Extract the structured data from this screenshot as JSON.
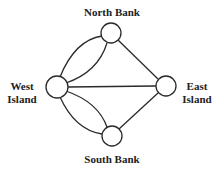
{
  "colors": {
    "stroke": "#2a2a2a",
    "node_fill": "#ffffff",
    "text": "#222222"
  },
  "nodes": [
    {
      "id": "north",
      "label": "North Bank",
      "x": 111,
      "y": 33,
      "r": 10
    },
    {
      "id": "west",
      "label": "West\nIsland",
      "x": 57,
      "y": 87,
      "r": 11
    },
    {
      "id": "east",
      "label": "East\nIsland",
      "x": 166,
      "y": 86,
      "r": 10
    },
    {
      "id": "south",
      "label": "South Bank",
      "x": 112,
      "y": 136,
      "r": 10
    }
  ],
  "edges": [
    {
      "from": "west",
      "to": "north",
      "curve": "outer"
    },
    {
      "from": "west",
      "to": "north",
      "curve": "inner"
    },
    {
      "from": "west",
      "to": "south",
      "curve": "outer"
    },
    {
      "from": "west",
      "to": "south",
      "curve": "inner"
    },
    {
      "from": "west",
      "to": "east",
      "curve": "straight"
    },
    {
      "from": "north",
      "to": "east",
      "curve": "straight"
    },
    {
      "from": "south",
      "to": "east",
      "curve": "straight"
    }
  ],
  "labels": {
    "north": "North Bank",
    "west": "West\nIsland",
    "east": "East\nIsland",
    "south": "South Bank"
  }
}
